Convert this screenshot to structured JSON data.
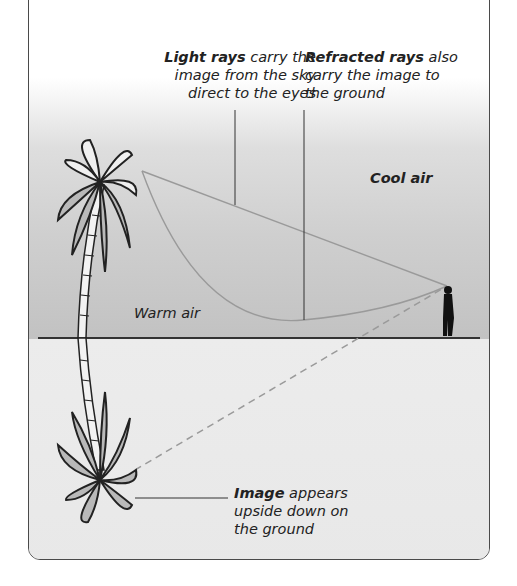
{
  "diagram": {
    "title_cut": "",
    "labels": {
      "light_rays": {
        "bold": "Light rays",
        "rest_line1": " carry the",
        "line2": "image from the sky",
        "line3": "direct to the eyes"
      },
      "refracted_rays": {
        "bold": "Refracted rays",
        "rest_line1": " also",
        "line2": "carry the image to",
        "line3": "the ground"
      },
      "cool_air": "Cool air",
      "warm_air": "Warm air",
      "image": {
        "bold": "Image",
        "rest_line1": " appears",
        "line2": "upside down on",
        "line3": "the ground"
      }
    },
    "elements": [
      "palm-tree",
      "reflected-palm-tree",
      "observer",
      "direct-ray",
      "refracted-ray",
      "apparent-ray-dashed",
      "ground-line"
    ],
    "colors": {
      "ray": "#9a9a9a",
      "outline": "#222222",
      "leaf_fill": "#b5b5b5",
      "frame": "#4a4a4a"
    }
  }
}
